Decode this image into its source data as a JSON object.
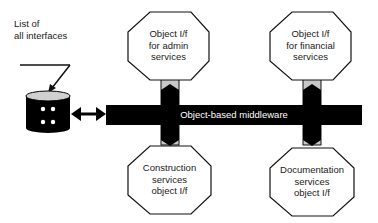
{
  "diagram": {
    "annotation": {
      "line1": "List of",
      "line2": "all interfaces"
    },
    "middleware": {
      "label": "Object-based middleware"
    },
    "nodes": {
      "admin": {
        "line1": "Object I/f",
        "line2": "for admin",
        "line3": "services"
      },
      "financial": {
        "line1": "Object I/f",
        "line2": "for financial",
        "line3": "services"
      },
      "construction": {
        "line1": "Construction",
        "line2": "services",
        "line3": "object I/f"
      },
      "documentation": {
        "line1": "Documentation",
        "line2": "services",
        "line3": "object I/f"
      }
    },
    "repository_icon": "database-icon",
    "colors": {
      "bar": "#000000",
      "connector": "#c8c8c8",
      "node_fill": "#ffffff",
      "stroke": "#111111"
    }
  }
}
